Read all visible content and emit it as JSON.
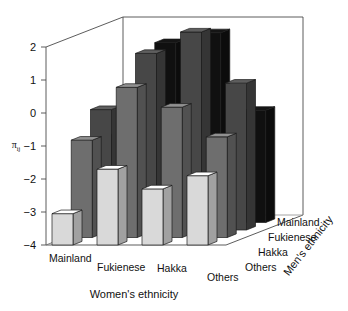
{
  "chart_data": {
    "type": "bar",
    "title": "",
    "subtitle": "",
    "is_3d": true,
    "xlabel": "Women's ethnicity",
    "zlabel": "Men's ethnicity",
    "ylabel": "π",
    "ylabel_sub": "ij",
    "ylim": [
      -4,
      2
    ],
    "yticks": [
      2,
      1,
      0,
      -1,
      -2,
      -3,
      -4
    ],
    "ytick_labels": [
      "2",
      "1",
      "0",
      "−1",
      "−2",
      "−3",
      "−4"
    ],
    "grid": false,
    "legend": "none",
    "categories": [
      "Mainland",
      "Fukienese",
      "Hakka",
      "Others"
    ],
    "depth_categories": [
      "Mainland",
      "Fukienese",
      "Hakka",
      "Others"
    ],
    "baseline": -4,
    "series": [
      {
        "name": "Mainland",
        "shade": "#d9d9d9",
        "values": [
          -3.05,
          -1.7,
          -2.3,
          -1.9
        ]
      },
      {
        "name": "Fukienese",
        "shade": "#6e6e6e",
        "values": [
          -1.05,
          0.55,
          -0.05,
          -0.95
        ]
      },
      {
        "name": "Hakka",
        "shade": "#474747",
        "values": [
          -0.35,
          1.35,
          2.0,
          0.45
        ]
      },
      {
        "name": "Others",
        "shade": "#101010",
        "values": [
          -1.35,
          1.45,
          1.75,
          -0.6
        ]
      }
    ],
    "bar_colors": {
      "mainland": "#d9d9d9",
      "fukienese": "#6e6e6e",
      "hakka": "#474747",
      "others": "#101010"
    }
  },
  "axes": {
    "y_ticks": [
      "2",
      "1",
      "0",
      "−1",
      "−2",
      "−3",
      "−4"
    ],
    "x_categories": [
      "Mainland",
      "Fukienese",
      "Hakka",
      "Others"
    ],
    "z_categories": [
      "Mainland",
      "Fukienese",
      "Hakka",
      "Others"
    ],
    "x_title": "Women's ethnicity",
    "z_title": "Men's ethnicity",
    "y_title": "π",
    "y_title_sub": "ij"
  },
  "caption": {
    "text": "",
    "visible": false
  }
}
